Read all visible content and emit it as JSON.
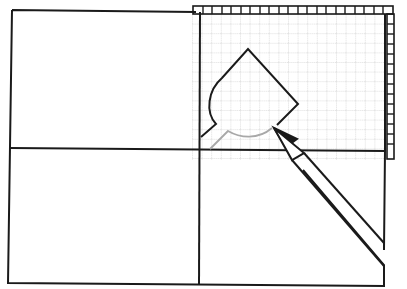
{
  "illustration": {
    "description": "Line drawing: a sheet divided into four panels with a gridded tracing-paper overlay on the upper-right quadrant; a pencil traces a curved pointed shape on the grid",
    "colors": {
      "ink": "#1a1a1a",
      "grid": "#bdbdbd",
      "faint_trace": "#a8a8a8",
      "background": "#ffffff"
    },
    "elements": [
      {
        "name": "sheet",
        "kind": "rectangle-outline"
      },
      {
        "name": "vertical-fold-line",
        "kind": "line"
      },
      {
        "name": "horizontal-fold-line",
        "kind": "line"
      },
      {
        "name": "tracing-grid-overlay",
        "kind": "grid"
      },
      {
        "name": "traced-shape",
        "kind": "outline"
      },
      {
        "name": "pencil",
        "kind": "icon"
      }
    ]
  }
}
